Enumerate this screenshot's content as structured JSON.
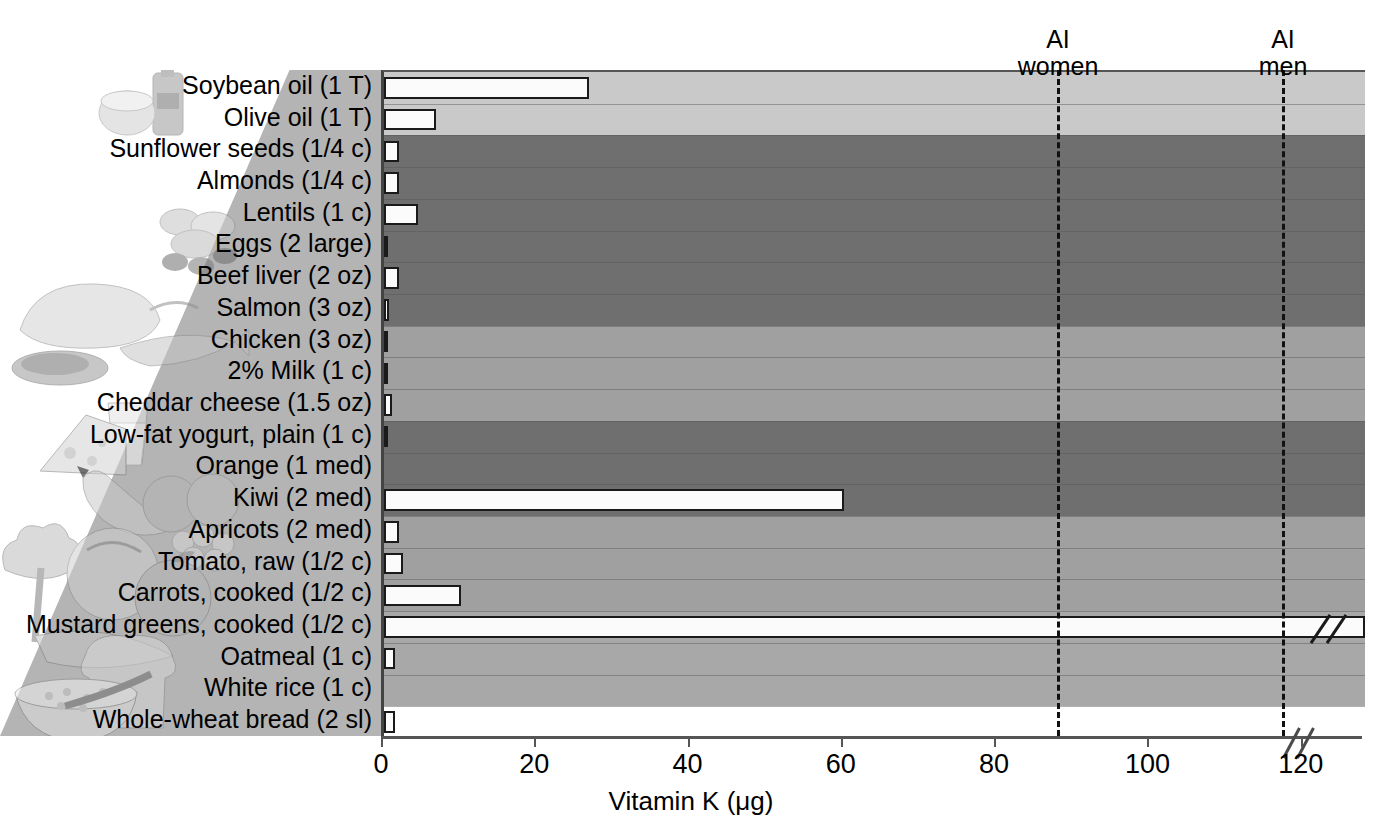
{
  "figure": {
    "x_title": "Vitamin K (μg)",
    "axis_max": 120,
    "axis_display_max": 128,
    "ticks": [
      0,
      20,
      40,
      60,
      80,
      100,
      120
    ],
    "has_axis_break": true
  },
  "reference_lines": [
    {
      "name": "ai-women",
      "line1": "AI",
      "line2": "women",
      "value": 90
    },
    {
      "name": "ai-men",
      "line1": "AI",
      "line2": "men",
      "value": 120
    }
  ],
  "groups": [
    {
      "name": "oils",
      "shade": "#c9c9c9",
      "rows": 2
    },
    {
      "name": "protein",
      "shade": "#6f6f6f",
      "rows": 6
    },
    {
      "name": "dairy",
      "shade": "#a0a0a0",
      "rows": 3
    },
    {
      "name": "fruits",
      "shade": "#6f6f6f",
      "rows": 3
    },
    {
      "name": "veg",
      "shade": "#a0a0a0",
      "rows": 3
    },
    {
      "name": "grains",
      "shade": "#a8a8a8",
      "rows": 3
    }
  ],
  "chart_data": {
    "type": "bar",
    "title": "",
    "xlabel": "Vitamin K (μg)",
    "ylabel": "",
    "orientation": "horizontal",
    "xlim": [
      0,
      120
    ],
    "grid": false,
    "legend": "none",
    "categories": [
      "Soybean oil (1 T)",
      "Olive oil (1 T)",
      "Sunflower seeds (1/4 c)",
      "Almonds (1/4 c)",
      "Lentils (1 c)",
      "Eggs (2 large)",
      "Beef liver (2 oz)",
      "Salmon (3 oz)",
      "Chicken (3 oz)",
      "2% Milk (1 c)",
      "Cheddar cheese (1.5 oz)",
      "Low-fat yogurt, plain (1 c)",
      "Orange (1 med)",
      "Kiwi (2 med)",
      "Apricots (2 med)",
      "Tomato, raw (1/2 c)",
      "Carrots, cooked (1/2 c)",
      "Mustard greens, cooked (1/2 c)",
      "Oatmeal (1 c)",
      "White rice (1 c)",
      "Whole-wheat bread (2 sl)"
    ],
    "values": [
      26.8,
      6.8,
      2,
      2,
      4.5,
      0.5,
      2,
      0.6,
      0.3,
      0.5,
      1,
      0.4,
      0,
      60,
      2,
      2.5,
      10,
      128,
      1.5,
      0,
      1.5
    ],
    "value_notes": {
      "Mustard greens, cooked (1/2 c)": "exceeds axis — bar drawn with break symbol"
    },
    "group_of_category": [
      "oils",
      "oils",
      "protein",
      "protein",
      "protein",
      "protein",
      "protein",
      "protein",
      "dairy",
      "dairy",
      "dairy",
      "fruits",
      "fruits",
      "fruits",
      "veg",
      "veg",
      "veg",
      "grains",
      "grains",
      "grains"
    ],
    "annotations": [
      {
        "text": "AI women",
        "x": 90
      },
      {
        "text": "AI men",
        "x": 120
      }
    ]
  },
  "illustrations": [
    {
      "name": "oil-bottle-and-cup",
      "group": "oils"
    },
    {
      "name": "nuts-and-seeds",
      "group": "protein"
    },
    {
      "name": "poultry-meat-fish",
      "group": "protein"
    },
    {
      "name": "cheese-and-milk-glass",
      "group": "dairy"
    },
    {
      "name": "fruit-assortment",
      "group": "fruits"
    },
    {
      "name": "vegetable-assortment",
      "group": "veg"
    },
    {
      "name": "bread-and-oatmeal-bowl",
      "group": "grains"
    }
  ]
}
